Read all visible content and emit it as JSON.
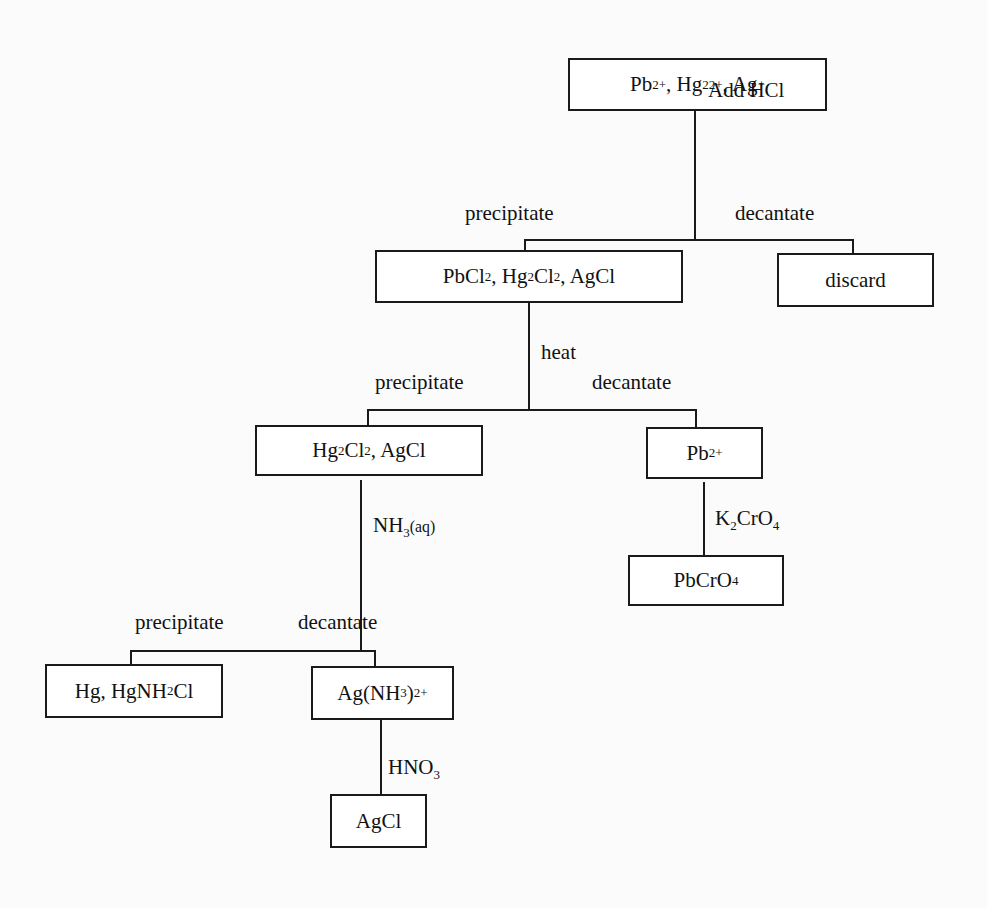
{
  "diagram": {
    "nodes": {
      "start": {
        "parts": [
          "Pb",
          {
            "sup": "2+"
          },
          ", Hg",
          {
            "sub": "2"
          },
          {
            "sup": "2+"
          },
          ", Ag",
          {
            "sup": "+"
          }
        ],
        "text": "Pb2+, Hg2 2+, Ag+"
      },
      "chlorides": {
        "parts": [
          "PbCl",
          {
            "sub": "2"
          },
          ", Hg",
          {
            "sub": "2"
          },
          "Cl",
          {
            "sub": "2"
          },
          ", AgCl"
        ],
        "text": "PbCl2, Hg2Cl2, AgCl"
      },
      "discard": {
        "parts": [
          "discard"
        ],
        "text": "discard"
      },
      "hg_ag_chlorides": {
        "parts": [
          "Hg",
          {
            "sub": "2"
          },
          "Cl",
          {
            "sub": "2"
          },
          ", AgCl"
        ],
        "text": "Hg2Cl2, AgCl"
      },
      "lead_ion": {
        "parts": [
          "Pb",
          {
            "sup": "2+"
          }
        ],
        "text": "Pb2+"
      },
      "lead_chromate": {
        "parts": [
          "PbCrO",
          {
            "sub": "4"
          }
        ],
        "text": "PbCrO4"
      },
      "mercury_products": {
        "parts": [
          "Hg, HgNH",
          {
            "sub": "2"
          },
          "Cl"
        ],
        "text": "Hg, HgNH2Cl"
      },
      "silver_ammine": {
        "parts": [
          "Ag(NH",
          {
            "sub": "3"
          },
          ")",
          {
            "sub": "2"
          },
          {
            "sup": "+"
          }
        ],
        "text": "Ag(NH3)2+"
      },
      "silver_chloride": {
        "parts": [
          "AgCl"
        ],
        "text": "AgCl"
      }
    },
    "reagents": {
      "add_hcl": {
        "parts": [
          "Add HCl"
        ]
      },
      "heat": {
        "parts": [
          "heat"
        ]
      },
      "k2cro4": {
        "parts": [
          "K",
          {
            "sub": "2"
          },
          "CrO",
          {
            "sub": "4"
          }
        ]
      },
      "nh3": {
        "parts": [
          "NH",
          {
            "sub": "3"
          },
          {
            "small": "(aq)"
          }
        ]
      },
      "hno3": {
        "parts": [
          "HNO",
          {
            "sub": "3"
          }
        ]
      }
    },
    "branch_labels": {
      "precipitate": "precipitate",
      "decantate": "decantate"
    }
  }
}
